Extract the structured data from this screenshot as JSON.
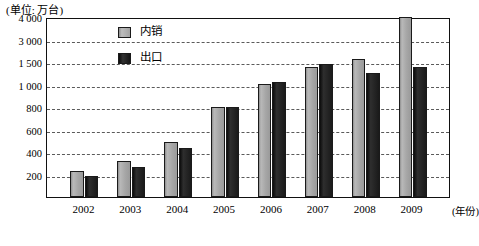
{
  "chart_data": {
    "type": "bar",
    "title": "(单位: 万台)",
    "xlabel": "(年份)",
    "ylabel": "",
    "categories": [
      "2002",
      "2003",
      "2004",
      "2005",
      "2006",
      "2007",
      "2008",
      "2009"
    ],
    "series": [
      {
        "name": "内销",
        "color": "#a9a9a9",
        "values": [
          230,
          320,
          490,
          800,
          1020,
          1400,
          1700,
          4000
        ]
      },
      {
        "name": "出口",
        "color": "#1d1d1d",
        "values": [
          185,
          270,
          440,
          800,
          1050,
          1450,
          1250,
          1400
        ]
      }
    ],
    "y_ticks": [
      200,
      400,
      600,
      800,
      1000,
      1500,
      3000,
      4000
    ],
    "y_tick_labels": [
      "200",
      "400",
      "600",
      "800",
      "1 000",
      "1 500",
      "3 000",
      "4 000"
    ],
    "y_axis_scale": "non-linear (evenly spaced irregular ticks)",
    "grid": true,
    "legend_position": "top-left-inside"
  },
  "legend": {
    "items": [
      {
        "label": "内销",
        "swatch": "domestic"
      },
      {
        "label": "出口",
        "swatch": "export"
      }
    ]
  }
}
